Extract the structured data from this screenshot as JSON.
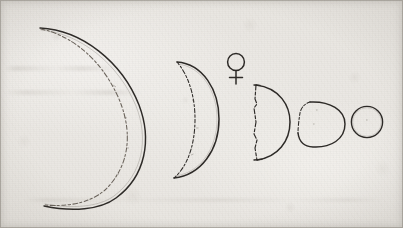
{
  "plate": {
    "name": "phases-of-venus-engraving",
    "medium": "ink drawing on aged paper",
    "caption": "",
    "background_color": "#eceae6",
    "ink_color": "#2d2a27",
    "paper_tone": "#e7e4df",
    "width": 403,
    "height": 228
  },
  "symbol": {
    "name": "venus-symbol",
    "glyph": "♀",
    "label": "Venus"
  },
  "phases": [
    {
      "index": 1,
      "name": "thin-crescent",
      "label": "",
      "illumination_percent": 8,
      "center_x": 93,
      "center_y": 116,
      "radius": 52,
      "terminator_style": "dashed"
    },
    {
      "index": 2,
      "name": "crescent",
      "label": "",
      "illumination_percent": 26,
      "center_x": 194,
      "center_y": 119,
      "radius": 60,
      "terminator_style": "dashed"
    },
    {
      "index": 3,
      "name": "half-phase-dichotomy",
      "label": "",
      "illumination_percent": 50,
      "center_x": 270,
      "center_y": 122,
      "radius": 38,
      "terminator_style": "dashed-straight"
    },
    {
      "index": 4,
      "name": "gibbous",
      "label": "",
      "illumination_percent": 78,
      "center_x": 322,
      "center_y": 124,
      "radius": 24,
      "terminator_style": "irregular"
    },
    {
      "index": 5,
      "name": "full-disc",
      "label": "",
      "illumination_percent": 100,
      "center_x": 367,
      "center_y": 122,
      "radius": 16,
      "terminator_style": "none"
    }
  ]
}
